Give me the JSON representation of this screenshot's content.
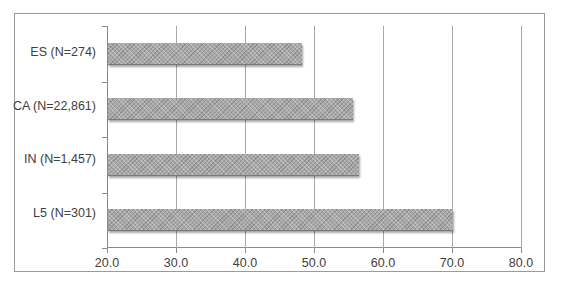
{
  "chart_data": {
    "type": "bar",
    "orientation": "horizontal",
    "title": "",
    "xlabel": "",
    "ylabel": "",
    "categories": [
      "ES (N=274)",
      "CA (N=22,861)",
      "IN (N=1,457)",
      "L5 (N=301)"
    ],
    "values": [
      48.1,
      55.5,
      56.4,
      70.0
    ],
    "xlim": [
      20.0,
      80.0
    ],
    "x_ticks": [
      "20.0",
      "30.0",
      "40.0",
      "50.0",
      "60.0",
      "70.0",
      "80.0"
    ],
    "grid": "vertical",
    "legend": null,
    "bar_color": "#a9a9a9"
  },
  "labels": {
    "categories": [
      "ES (N=274)",
      "CA (N=22,861)",
      "IN (N=1,457)",
      "L5 (N=301)"
    ],
    "x_ticks": [
      "20.0",
      "30.0",
      "40.0",
      "50.0",
      "60.0",
      "70.0",
      "80.0"
    ]
  }
}
